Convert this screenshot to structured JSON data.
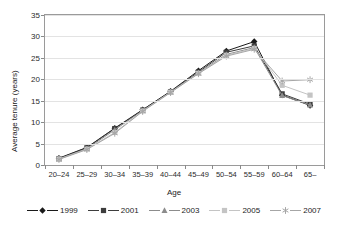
{
  "chart_data": {
    "type": "line",
    "title": "",
    "xlabel": "Age",
    "ylabel": "Average tenure (years)",
    "categories": [
      "20–24",
      "25–29",
      "30–34",
      "35–39",
      "40–44",
      "45–49",
      "50–54",
      "55–59",
      "60–64",
      "65–"
    ],
    "ylim": [
      0,
      35
    ],
    "yticks": [
      0,
      5,
      10,
      15,
      20,
      25,
      30,
      35
    ],
    "grid": true,
    "legend_position": "bottom",
    "series": [
      {
        "name": "1999",
        "marker": "diamond",
        "color": "#1a1a1a",
        "values": [
          1.6,
          4.1,
          8.6,
          12.9,
          17.2,
          22.0,
          26.6,
          28.8,
          16.3,
          13.9
        ]
      },
      {
        "name": "2001",
        "marker": "square",
        "color": "#3d3d3d",
        "values": [
          1.5,
          4.0,
          8.5,
          12.8,
          17.1,
          21.7,
          26.3,
          27.8,
          16.6,
          14.2
        ]
      },
      {
        "name": "2003",
        "marker": "triangle",
        "color": "#8c8c8c",
        "values": [
          1.4,
          3.8,
          8.2,
          12.7,
          17.0,
          21.5,
          25.8,
          27.4,
          16.2,
          14.0
        ]
      },
      {
        "name": "2005",
        "marker": "square-light",
        "color": "#c4c4c4",
        "values": [
          1.4,
          3.7,
          7.6,
          12.6,
          17.0,
          21.4,
          25.6,
          27.2,
          18.6,
          16.3
        ]
      },
      {
        "name": "2007",
        "marker": "asterisk",
        "color": "#a6a6a6",
        "values": [
          1.3,
          3.6,
          7.4,
          12.5,
          16.9,
          21.3,
          25.4,
          27.0,
          19.6,
          19.9
        ]
      }
    ]
  },
  "legend": {
    "items": [
      {
        "label": "1999"
      },
      {
        "label": "2001"
      },
      {
        "label": "2003"
      },
      {
        "label": "2005"
      },
      {
        "label": "2007"
      }
    ]
  }
}
